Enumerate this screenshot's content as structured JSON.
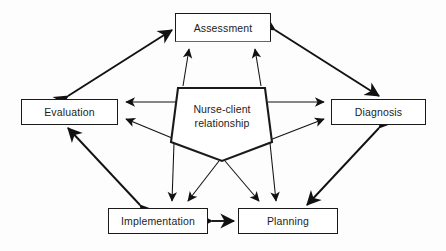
{
  "diagram": {
    "center": {
      "name": "nurse-client-relationship",
      "line1": "Nurse-client",
      "line2": "relationship",
      "shape": "pentagon",
      "stroke_color": "#1a1a1a"
    },
    "nodes": [
      {
        "id": "assessment",
        "label": "Assessment",
        "position": "top",
        "x": 175,
        "y": 13,
        "w": 96,
        "h": 29,
        "accent_color": "#4c7a4c"
      },
      {
        "id": "evaluation",
        "label": "Evaluation",
        "position": "left",
        "x": 21,
        "y": 99,
        "w": 97,
        "h": 26,
        "accent_color": "#1a1a1a"
      },
      {
        "id": "diagnosis",
        "label": "Diagnosis",
        "position": "right",
        "x": 331,
        "y": 99,
        "w": 95,
        "h": 26,
        "accent_color": "#1a1a1a"
      },
      {
        "id": "implementation",
        "label": "Implementation",
        "position": "bottom-left",
        "x": 108,
        "y": 208,
        "w": 100,
        "h": 26,
        "accent_color": "#1a1a1a"
      },
      {
        "id": "planning",
        "label": "Planning",
        "position": "bottom-right",
        "x": 238,
        "y": 208,
        "w": 100,
        "h": 26,
        "accent_color": "#1a1a1a"
      }
    ],
    "outer_connectors": [
      {
        "from": "evaluation",
        "to": "assessment",
        "style": "thick",
        "arrowheads": "both"
      },
      {
        "from": "assessment",
        "to": "diagnosis",
        "style": "thick",
        "arrowheads": "both"
      },
      {
        "from": "diagnosis",
        "to": "planning",
        "style": "thick",
        "arrowheads": "both"
      },
      {
        "from": "planning",
        "to": "implementation",
        "style": "thick",
        "arrowheads": "both"
      },
      {
        "from": "implementation",
        "to": "evaluation",
        "style": "thick",
        "arrowheads": "both"
      }
    ],
    "center_connectors": [
      {
        "from": "nurse-client-relationship",
        "to": "assessment",
        "style": "thin",
        "arrowheads": "single"
      },
      {
        "from": "nurse-client-relationship",
        "to": "evaluation",
        "style": "thin",
        "arrowheads": "single"
      },
      {
        "from": "nurse-client-relationship",
        "to": "diagnosis",
        "style": "thin",
        "arrowheads": "single"
      },
      {
        "from": "nurse-client-relationship",
        "to": "implementation",
        "style": "thin",
        "arrowheads": "single"
      },
      {
        "from": "nurse-client-relationship",
        "to": "planning",
        "style": "thin",
        "arrowheads": "single"
      }
    ],
    "colors": {
      "stroke": "#1a1a1a",
      "background": "#fdfdfd",
      "text": "#1c1c1c",
      "assessment_accent": "#4c7a4c"
    }
  }
}
